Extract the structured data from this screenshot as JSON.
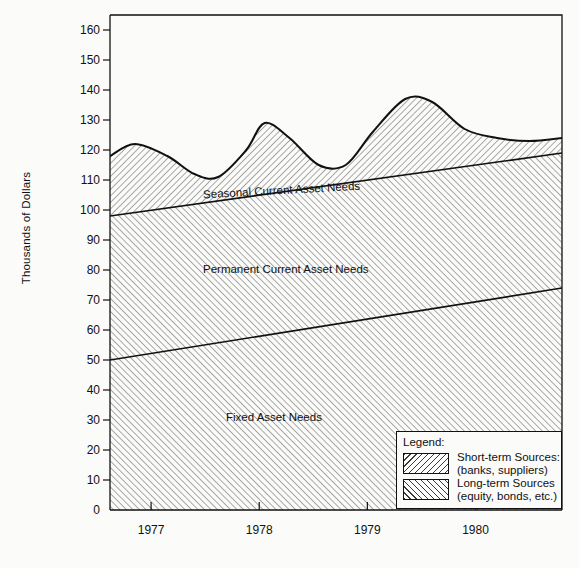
{
  "chart_data": {
    "type": "area",
    "title": "",
    "xlabel": "",
    "ylabel": "Thousands of Dollars",
    "ylim": [
      0,
      165
    ],
    "yticks": [
      0,
      10,
      20,
      30,
      40,
      50,
      60,
      70,
      80,
      90,
      100,
      110,
      120,
      130,
      140,
      150,
      160
    ],
    "ytick_labels": [
      "0",
      "10",
      "20",
      "30",
      "40",
      "50",
      "60",
      "70",
      "80",
      "90",
      "100",
      "110",
      "120",
      "130",
      "140",
      "150",
      "160"
    ],
    "xticks": [
      "1977",
      "1978",
      "1979",
      "1980"
    ],
    "xlim_years": [
      1976.62,
      1980.8
    ],
    "grid": false,
    "legend_position": "inside-bottom-right",
    "series": [
      {
        "name": "Fixed Asset Needs",
        "label_in_chart": "Fixed Asset Needs",
        "type": "linear-boundary",
        "fill": "long-term",
        "points": [
          {
            "x": 1976.62,
            "y": 50
          },
          {
            "x": 1980.8,
            "y": 74
          }
        ]
      },
      {
        "name": "Permanent Current Asset Needs",
        "label_in_chart": "Permanent Current Asset Needs",
        "type": "linear-boundary",
        "fill": "long-term",
        "points": [
          {
            "x": 1976.62,
            "y": 98
          },
          {
            "x": 1980.8,
            "y": 119
          }
        ]
      },
      {
        "name": "Seasonal Current Asset Needs",
        "label_in_chart": "Seasonal Current Asset Needs",
        "type": "wave-boundary",
        "fill": "short-term",
        "points": [
          {
            "x": 1976.62,
            "y": 118
          },
          {
            "x": 1976.85,
            "y": 122
          },
          {
            "x": 1977.15,
            "y": 118
          },
          {
            "x": 1977.4,
            "y": 112
          },
          {
            "x": 1977.62,
            "y": 111
          },
          {
            "x": 1977.88,
            "y": 120
          },
          {
            "x": 1978.05,
            "y": 129
          },
          {
            "x": 1978.28,
            "y": 124
          },
          {
            "x": 1978.55,
            "y": 115
          },
          {
            "x": 1978.8,
            "y": 115
          },
          {
            "x": 1979.05,
            "y": 126
          },
          {
            "x": 1979.35,
            "y": 137
          },
          {
            "x": 1979.6,
            "y": 136
          },
          {
            "x": 1979.9,
            "y": 127
          },
          {
            "x": 1980.2,
            "y": 124
          },
          {
            "x": 1980.5,
            "y": 123
          },
          {
            "x": 1980.8,
            "y": 124
          }
        ]
      }
    ],
    "annotations": [
      "Seasonal Current Asset Needs",
      "Permanent Current Asset Needs",
      "Fixed Asset Needs"
    ]
  },
  "axis": {
    "y_title": "Thousands of Dollars",
    "y_tick_labels": [
      "160",
      "150",
      "140",
      "130",
      "120",
      "110",
      "100",
      "90",
      "80",
      "70",
      "60",
      "50",
      "40",
      "30",
      "20",
      "10",
      "0"
    ],
    "x_tick_labels": [
      "1977",
      "1978",
      "1979",
      "1980"
    ]
  },
  "area_labels": {
    "seasonal": "Seasonal Current Asset Needs",
    "permanent": "Permanent Current Asset Needs",
    "fixed": "Fixed Asset Needs"
  },
  "legend": {
    "title": "Legend:",
    "entries": [
      {
        "line1": "Short-term Sources:",
        "line2": "(banks, suppliers)",
        "pattern": "hatch-backslash"
      },
      {
        "line1": "Long-term Sources",
        "line2": "(equity, bonds, etc.)",
        "pattern": "hatch-slash"
      }
    ]
  },
  "caption": {
    "text": ""
  },
  "colors": {
    "ink": "#111111",
    "paper": "#fbfbf9",
    "hatch": "#3a3a3a"
  }
}
